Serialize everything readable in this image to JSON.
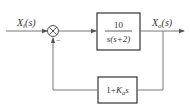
{
  "diagram": {
    "type": "block-diagram",
    "input": {
      "symbol": "X",
      "subscript": "i",
      "arg": "(s)"
    },
    "output": {
      "symbol": "X",
      "subscript": "o",
      "arg": "(s)"
    },
    "summing_junction": {
      "input_sign": "+",
      "feedback_sign": "−"
    },
    "forward_block": {
      "numerator": "10",
      "denominator": "s(s+2)"
    },
    "feedback_block": {
      "prefix": "1+",
      "symbol": "K",
      "subscript": "a",
      "suffix": "s"
    },
    "colors": {
      "line": "#777777",
      "block_border": "#333333",
      "text": "#333333"
    }
  }
}
